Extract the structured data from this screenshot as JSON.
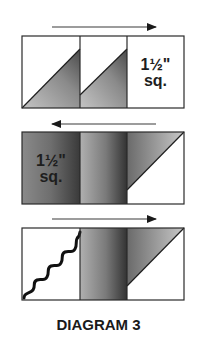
{
  "diagram": {
    "caption": "DIAGRAM 3",
    "colors": {
      "outline": "#2a2a2a",
      "white": "#ffffff",
      "gradient_light": "#b4b4b4",
      "gradient_dark": "#3c3c3c",
      "text": "#1e1e1e"
    },
    "rows": [
      {
        "arrow_direction": "right",
        "cells": [
          {
            "type": "half-square-triangle",
            "fill": "lower-right gray triangle"
          },
          {
            "type": "half-square-triangle",
            "fill": "lower-right gray triangle with strip"
          },
          {
            "type": "plain-square",
            "label_line1": "1½\"",
            "label_line2": "sq."
          }
        ]
      },
      {
        "arrow_direction": "left",
        "cells": [
          {
            "type": "gray-square",
            "label_line1": "1½\"",
            "label_line2": "sq."
          },
          {
            "type": "gray-strip"
          },
          {
            "type": "half-square-triangle",
            "fill": "upper-left gray triangle"
          }
        ]
      },
      {
        "arrow_direction": "right",
        "cells": [
          {
            "type": "white-square-with-wavy-seam"
          },
          {
            "type": "gray-strip"
          },
          {
            "type": "half-square-triangle",
            "fill": "upper-left gray triangle"
          }
        ]
      }
    ]
  }
}
